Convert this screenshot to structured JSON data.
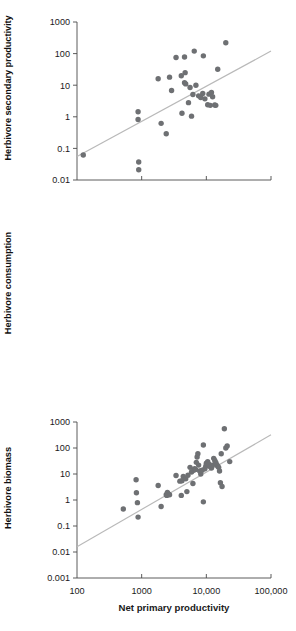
{
  "figure": {
    "title": "",
    "x_axis_title": "Net primary productivity",
    "point_color": "#6e7073",
    "trend_color": "#b9b9b9",
    "axis_color": "#4a4a4a"
  },
  "panels": [
    {
      "id": "herbivore-secondary-productivity",
      "ylabel": "Herbivore secondary productivity"
    },
    {
      "id": "herbivore-consumption",
      "ylabel": "Herbivore consumption"
    },
    {
      "id": "herbivore-biomass",
      "ylabel": "Herbivore biomass"
    }
  ],
  "chart_data": [
    {
      "type": "scatter",
      "title": "",
      "xlabel": "Net primary productivity",
      "ylabel": "Herbivore secondary productivity",
      "xscale": "log",
      "yscale": "log",
      "xlim": [
        100,
        100000
      ],
      "ylim": [
        0.01,
        1000
      ],
      "xticks": [
        100,
        1000,
        10000,
        100000
      ],
      "xticklabels": [
        "100",
        "1000",
        "10,000",
        "100,000"
      ],
      "yticks": [
        0.01,
        0.1,
        1,
        10,
        100,
        1000
      ],
      "yticklabels": [
        "0.01",
        "0.1",
        "1",
        "10",
        "100",
        "1000"
      ],
      "grid": false,
      "legend": false,
      "trendline": {
        "x": [
          100,
          100000
        ],
        "y": [
          0.055,
          120
        ]
      },
      "points": [
        [
          125,
          0.062
        ],
        [
          880,
          1.45
        ],
        [
          880,
          0.82
        ],
        [
          900,
          0.037
        ],
        [
          900,
          0.021
        ],
        [
          2000,
          0.62
        ],
        [
          2400,
          0.29
        ],
        [
          1800,
          16
        ],
        [
          2700,
          18
        ],
        [
          2900,
          6.8
        ],
        [
          3400,
          75
        ],
        [
          4600,
          78
        ],
        [
          4100,
          20
        ],
        [
          4700,
          25
        ],
        [
          4600,
          12
        ],
        [
          4800,
          11
        ],
        [
          4200,
          1.3
        ],
        [
          5900,
          1.05
        ],
        [
          6500,
          120
        ],
        [
          5600,
          8.5
        ],
        [
          6200,
          5.1
        ],
        [
          5300,
          2.8
        ],
        [
          6900,
          10
        ],
        [
          7600,
          4.6
        ],
        [
          8200,
          4.1
        ],
        [
          8800,
          5.5
        ],
        [
          9500,
          3.7
        ],
        [
          10500,
          2.4
        ],
        [
          11500,
          2.3
        ],
        [
          11000,
          5.2
        ],
        [
          12000,
          5.9
        ],
        [
          12500,
          4.3
        ],
        [
          13500,
          2.35
        ],
        [
          14000,
          2.3
        ],
        [
          9000,
          85
        ],
        [
          15000,
          32
        ],
        [
          20000,
          220
        ]
      ]
    },
    {
      "type": "scatter",
      "title": "",
      "xlabel": "Net primary productivity",
      "ylabel": "Herbivore consumption",
      "xscale": "log",
      "yscale": "log",
      "xlim": [
        100,
        100000
      ],
      "ylim": [
        1,
        100000
      ],
      "xticks": [
        100,
        1000,
        10000,
        100000
      ],
      "xticklabels": [
        "100",
        "1000",
        "10,000",
        "100,000"
      ],
      "yticks": [
        1,
        10,
        100,
        1000,
        10000,
        100000
      ],
      "yticklabels": [
        "1",
        "10",
        "100",
        "1000",
        "10,000",
        "100,000"
      ],
      "grid": false,
      "legend": false,
      "trendline": {
        "x": [
          100,
          100000
        ],
        "y": [
          2.4,
          48000
        ]
      },
      "points": [
        [
          880,
          140
        ],
        [
          900,
          160
        ],
        [
          880,
          78
        ],
        [
          900,
          3.0
        ],
        [
          900,
          1.85
        ],
        [
          2000,
          1.0
        ],
        [
          1700,
          1500
        ],
        [
          1900,
          130
        ],
        [
          2300,
          125
        ],
        [
          2400,
          50
        ],
        [
          2700,
          400
        ],
        [
          2700,
          46
        ],
        [
          2900,
          38
        ],
        [
          3000,
          450
        ],
        [
          3100,
          480
        ],
        [
          3200,
          300
        ],
        [
          3300,
          700
        ],
        [
          3400,
          250
        ],
        [
          3600,
          180
        ],
        [
          3100,
          2100
        ],
        [
          3800,
          310
        ],
        [
          4000,
          270
        ],
        [
          4200,
          1450
        ],
        [
          4300,
          1900
        ],
        [
          4400,
          1700
        ],
        [
          4500,
          1300
        ],
        [
          4700,
          600
        ],
        [
          4900,
          450
        ],
        [
          5000,
          260
        ],
        [
          5200,
          300
        ],
        [
          5300,
          5000
        ],
        [
          5500,
          4800
        ],
        [
          5600,
          4600
        ],
        [
          5800,
          6000
        ],
        [
          6000,
          5200
        ],
        [
          6200,
          5600
        ],
        [
          6400,
          4500
        ],
        [
          6600,
          7000
        ],
        [
          6800,
          6500
        ],
        [
          7000,
          8000
        ],
        [
          7200,
          7500
        ],
        [
          7400,
          6800
        ],
        [
          6100,
          10000
        ],
        [
          6400,
          11000
        ],
        [
          7600,
          9500
        ],
        [
          8000,
          2600
        ],
        [
          8200,
          1900
        ],
        [
          8600,
          1100
        ],
        [
          9000,
          1000
        ],
        [
          9500,
          950
        ],
        [
          10000,
          90
        ],
        [
          11000,
          150
        ],
        [
          11500,
          55
        ],
        [
          12000,
          2400
        ],
        [
          12500,
          1800
        ],
        [
          13000,
          14000
        ],
        [
          13500,
          13000
        ],
        [
          14000,
          12500
        ],
        [
          14500,
          11500
        ],
        [
          15000,
          13000
        ],
        [
          16000,
          2300
        ],
        [
          17000,
          2200
        ],
        [
          18000,
          1000
        ],
        [
          19000,
          420
        ],
        [
          20000,
          350
        ],
        [
          21000,
          100
        ],
        [
          22000,
          2000
        ]
      ]
    },
    {
      "type": "scatter",
      "title": "",
      "xlabel": "Net primary productivity",
      "ylabel": "Herbivore biomass",
      "xscale": "log",
      "yscale": "log",
      "xlim": [
        100,
        100000
      ],
      "ylim": [
        0.001,
        1000
      ],
      "xticks": [
        100,
        1000,
        10000,
        100000
      ],
      "xticklabels": [
        "100",
        "1000",
        "10,000",
        "100,000"
      ],
      "yticks": [
        0.001,
        0.01,
        0.1,
        1,
        10,
        100,
        1000
      ],
      "yticklabels": [
        "0.001",
        "0.01",
        "0.1",
        "1",
        "10",
        "100",
        "1000"
      ],
      "grid": false,
      "legend": false,
      "trendline": {
        "x": [
          100,
          100000
        ],
        "y": [
          0.016,
          320
        ]
      },
      "points": [
        [
          520,
          0.45
        ],
        [
          820,
          6.0
        ],
        [
          830,
          1.9
        ],
        [
          860,
          0.79
        ],
        [
          880,
          0.22
        ],
        [
          1800,
          3.6
        ],
        [
          2000,
          0.56
        ],
        [
          2400,
          1.6
        ],
        [
          2450,
          1.5
        ],
        [
          2500,
          1.95
        ],
        [
          2600,
          1.7
        ],
        [
          2700,
          1.6
        ],
        [
          3400,
          8.8
        ],
        [
          3900,
          5.3
        ],
        [
          4200,
          5.5
        ],
        [
          4400,
          8.0
        ],
        [
          4800,
          6.5
        ],
        [
          5000,
          2.1
        ],
        [
          5600,
          18
        ],
        [
          5900,
          12
        ],
        [
          6200,
          4.3
        ],
        [
          6400,
          14
        ],
        [
          6600,
          16
        ],
        [
          6800,
          15
        ],
        [
          7000,
          28
        ],
        [
          7200,
          45
        ],
        [
          7400,
          60
        ],
        [
          7600,
          22
        ],
        [
          7900,
          13
        ],
        [
          8200,
          10
        ],
        [
          8600,
          14
        ],
        [
          9000,
          0.85
        ],
        [
          9500,
          16
        ],
        [
          9800,
          20
        ],
        [
          10000,
          26
        ],
        [
          10500,
          30
        ],
        [
          11000,
          24
        ],
        [
          11500,
          19
        ],
        [
          12000,
          17
        ],
        [
          12500,
          22
        ],
        [
          13000,
          40
        ],
        [
          13500,
          33
        ],
        [
          14000,
          28
        ],
        [
          14500,
          23
        ],
        [
          15000,
          20
        ],
        [
          15500,
          18
        ],
        [
          16000,
          13
        ],
        [
          16500,
          4.6
        ],
        [
          17000,
          60
        ],
        [
          17500,
          3.3
        ],
        [
          9000,
          130
        ],
        [
          19000,
          550
        ],
        [
          20000,
          100
        ],
        [
          21000,
          120
        ],
        [
          23000,
          30
        ],
        [
          5200,
          9.0
        ],
        [
          4100,
          1.5
        ]
      ]
    }
  ]
}
